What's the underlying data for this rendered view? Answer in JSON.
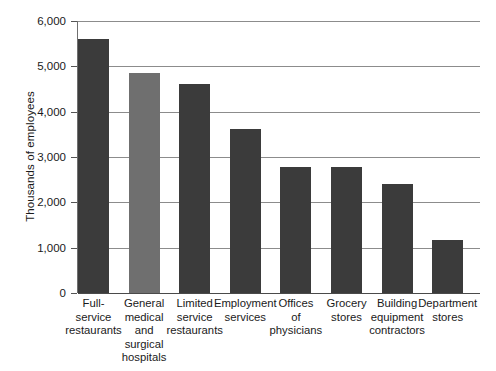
{
  "chart_data": {
    "type": "bar",
    "title": "",
    "xlabel": "",
    "ylabel": "Thousands of employees",
    "ylim": [
      0,
      6000
    ],
    "ytick_labels": [
      "6,000",
      "5,000",
      "4,000",
      "3,000",
      "2,000",
      "1,000",
      "0"
    ],
    "ytick_values": [
      6000,
      5000,
      4000,
      3000,
      2000,
      1000,
      0
    ],
    "grid": "horizontal",
    "legend": "none",
    "categories": [
      "Full-service restaurants",
      "General medical and surgical hospitals",
      "Limited service restaurants",
      "Employment services",
      "Offices of physicians",
      "Grocery stores",
      "Building equipment contractors",
      "Department stores"
    ],
    "category_lines": [
      [
        "Full-",
        "service",
        "restaurants"
      ],
      [
        "General",
        "medical",
        "and",
        "surgical",
        "hospitals"
      ],
      [
        "Limited",
        "service",
        "restaurants"
      ],
      [
        "Employment",
        "services"
      ],
      [
        "Offices",
        "of",
        "physicians"
      ],
      [
        "Grocery",
        "stores"
      ],
      [
        "Building",
        "equipment",
        "contractors"
      ],
      [
        "Department",
        "stores"
      ]
    ],
    "values": [
      5600,
      4850,
      4600,
      3620,
      2780,
      2780,
      2400,
      1180
    ],
    "bar_colors": [
      "#3b3b3b",
      "#6f6f6f",
      "#3b3b3b",
      "#3b3b3b",
      "#3b3b3b",
      "#3b3b3b",
      "#3b3b3b",
      "#3b3b3b"
    ],
    "highlight_color": "#6f6f6f",
    "primary_color": "#3b3b3b",
    "gridline_color": "#8c8c8c",
    "axis_color": "#4a4a4a"
  }
}
